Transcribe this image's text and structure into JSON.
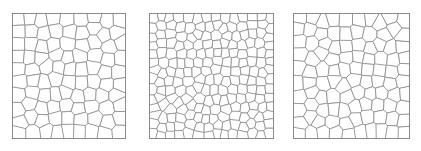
{
  "figure": {
    "title": "",
    "background_color": "#ffffff",
    "width": 421,
    "height": 151,
    "panel_count": 3
  },
  "style": {
    "edge_color": "#8a8a8a",
    "frame_color": "#8a8a8a",
    "cell_fill": "#ffffff",
    "edge_width": 0.8,
    "frame_width": 1
  },
  "chart_data": {
    "type": "diagram",
    "subtype": "voronoi-tessellation-panels",
    "title": "",
    "xlabel": "",
    "ylabel": "",
    "grid": false,
    "legend": "none",
    "panels": [
      {
        "id": "panel-1",
        "label": "",
        "x": 12,
        "y": 13,
        "width": 114,
        "height": 126,
        "seed": 17,
        "cell_count": 88,
        "relative_cell_size": "medium",
        "relaxation_steps": 2
      },
      {
        "id": "panel-2",
        "label": "",
        "x": 149,
        "y": 13,
        "width": 125,
        "height": 126,
        "seed": 43,
        "cell_count": 190,
        "relative_cell_size": "small",
        "relaxation_steps": 2
      },
      {
        "id": "panel-3",
        "label": "",
        "x": 293,
        "y": 13,
        "width": 117,
        "height": 126,
        "seed": 91,
        "cell_count": 104,
        "relative_cell_size": "medium",
        "relaxation_steps": 2
      }
    ]
  }
}
